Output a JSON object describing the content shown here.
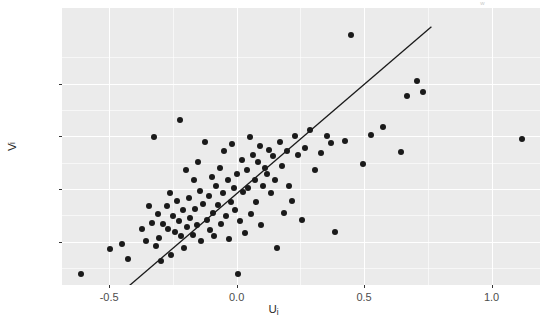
{
  "figure": {
    "width": 547,
    "height": 323,
    "background": "#ffffff",
    "corner_fragment": "w"
  },
  "theme": {
    "panel_background": "#EBEBEB",
    "gridline_color": "#FFFFFF",
    "point_color": "#1a1a1a",
    "line_color": "#1a1a1a",
    "tick_label_color": "#4d4d4d",
    "axis_title_color": "#2b2b2b"
  },
  "axes": {
    "x": {
      "title": "U",
      "title_subscript": "i",
      "ticks": [
        -0.5,
        0.0,
        0.5,
        1.0
      ],
      "tick_labels": [
        "-0.5",
        "0.0",
        "0.5",
        "1.0"
      ],
      "minor_ticks": [
        -0.25,
        0.25,
        0.75
      ],
      "range": [
        -0.685,
        1.19
      ]
    },
    "y": {
      "title": "V",
      "title_subscript": "i",
      "ticks": [
        -0.25,
        0.0,
        0.25,
        0.5
      ],
      "tick_labels": [
        "-0.25",
        "0.00",
        "0.25",
        "0.50"
      ],
      "minor_ticks": [
        -0.375,
        -0.125,
        0.125,
        0.375,
        0.625
      ],
      "range": [
        -0.4555,
        0.8589
      ]
    }
  },
  "chart_data": {
    "type": "scatter",
    "title": "",
    "xlabel": "U_i",
    "ylabel": "V_i",
    "xlim": [
      -0.685,
      1.19
    ],
    "ylim": [
      -0.4555,
      0.8589
    ],
    "grid": true,
    "legend": "none",
    "series": [
      {
        "name": "residual pairs",
        "marker": "filled-circle",
        "color": "#1a1a1a",
        "points": [
          [
            -0.61,
            -0.404
          ],
          [
            -0.496,
            -0.285
          ],
          [
            -0.449,
            -0.261
          ],
          [
            -0.425,
            -0.333
          ],
          [
            -0.37,
            -0.19
          ],
          [
            -0.354,
            -0.247
          ],
          [
            -0.343,
            -0.081
          ],
          [
            -0.331,
            -0.161
          ],
          [
            -0.323,
            0.247
          ],
          [
            -0.315,
            -0.271
          ],
          [
            -0.307,
            -0.119
          ],
          [
            -0.303,
            -0.233
          ],
          [
            -0.295,
            -0.342
          ],
          [
            -0.287,
            -0.166
          ],
          [
            -0.272,
            -0.081
          ],
          [
            -0.268,
            -0.19
          ],
          [
            -0.26,
            -0.019
          ],
          [
            -0.256,
            -0.313
          ],
          [
            -0.248,
            -0.128
          ],
          [
            -0.24,
            -0.204
          ],
          [
            -0.232,
            -0.057
          ],
          [
            -0.228,
            -0.152
          ],
          [
            -0.224,
            0.328
          ],
          [
            -0.217,
            -0.223
          ],
          [
            -0.209,
            -0.1
          ],
          [
            -0.205,
            -0.28
          ],
          [
            -0.197,
            0.09
          ],
          [
            -0.193,
            -0.18
          ],
          [
            -0.185,
            -0.043
          ],
          [
            -0.181,
            -0.137
          ],
          [
            -0.173,
            -0.218
          ],
          [
            -0.169,
            0.043
          ],
          [
            -0.162,
            -0.095
          ],
          [
            -0.154,
            -0.171
          ],
          [
            -0.15,
            0.128
          ],
          [
            -0.142,
            -0.009
          ],
          [
            -0.138,
            -0.247
          ],
          [
            -0.13,
            -0.071
          ],
          [
            -0.126,
            0.223
          ],
          [
            -0.118,
            -0.147
          ],
          [
            -0.11,
            -0.033
          ],
          [
            -0.106,
            -0.194
          ],
          [
            -0.098,
            0.057
          ],
          [
            -0.094,
            -0.114
          ],
          [
            -0.087,
            -0.223
          ],
          [
            -0.079,
            0.014
          ],
          [
            -0.075,
            -0.076
          ],
          [
            -0.067,
            0.1
          ],
          [
            -0.063,
            -0.166
          ],
          [
            -0.055,
            -0.019
          ],
          [
            -0.051,
            0.18
          ],
          [
            -0.043,
            -0.128
          ],
          [
            -0.035,
            0.043
          ],
          [
            -0.031,
            -0.237
          ],
          [
            -0.023,
            -0.062
          ],
          [
            -0.02,
            0.214
          ],
          [
            -0.012,
            0.005
          ],
          [
            -0.008,
            -0.1
          ],
          [
            0.0,
            0.071
          ],
          [
            0.004,
            -0.404
          ],
          [
            0.012,
            -0.152
          ],
          [
            0.02,
            0.138
          ],
          [
            0.024,
            -0.014
          ],
          [
            0.031,
            -0.209
          ],
          [
            0.039,
            0.09
          ],
          [
            0.043,
            0.005
          ],
          [
            0.051,
            0.247
          ],
          [
            0.055,
            -0.119
          ],
          [
            0.063,
            0.161
          ],
          [
            0.071,
            0.043
          ],
          [
            0.075,
            -0.062
          ],
          [
            0.082,
            0.128
          ],
          [
            0.09,
            0.204
          ],
          [
            0.094,
            -0.171
          ],
          [
            0.102,
            0.014
          ],
          [
            0.11,
            0.1
          ],
          [
            0.118,
            0.071
          ],
          [
            0.126,
            0.185
          ],
          [
            0.134,
            -0.019
          ],
          [
            0.142,
            0.157
          ],
          [
            0.15,
            0.043
          ],
          [
            0.158,
            -0.28
          ],
          [
            0.169,
            0.223
          ],
          [
            0.177,
            0.109
          ],
          [
            0.185,
            -0.114
          ],
          [
            0.197,
            0.18
          ],
          [
            0.205,
            0.014
          ],
          [
            0.217,
            -0.057
          ],
          [
            0.228,
            0.252
          ],
          [
            0.24,
            0.162
          ],
          [
            0.256,
            -0.147
          ],
          [
            0.268,
            0.195
          ],
          [
            0.287,
            0.281
          ],
          [
            0.307,
            0.09
          ],
          [
            0.331,
            0.171
          ],
          [
            0.354,
            0.252
          ],
          [
            0.37,
            0.219
          ],
          [
            0.386,
            -0.204
          ],
          [
            0.425,
            0.229
          ],
          [
            0.449,
            0.732
          ],
          [
            0.496,
            0.119
          ],
          [
            0.527,
            0.257
          ],
          [
            0.575,
            0.295
          ],
          [
            0.645,
            0.176
          ],
          [
            0.669,
            0.442
          ],
          [
            0.708,
            0.513
          ],
          [
            0.732,
            0.461
          ],
          [
            1.12,
            0.238
          ]
        ]
      }
    ],
    "fit_line": {
      "name": "fitted line",
      "color": "#1a1a1a",
      "x_start": -0.487,
      "y_start": -0.527,
      "x_end": 0.764,
      "y_end": 0.77,
      "slope": 1.037,
      "intercept": -0.022
    }
  }
}
